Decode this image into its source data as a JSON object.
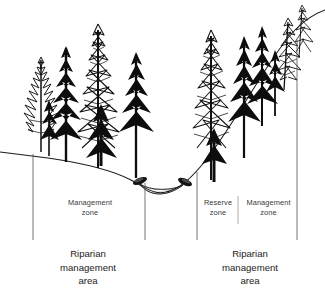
{
  "diagram": {
    "background_color": "#ffffff",
    "line_color": "#1a1a1a",
    "label_color": "#3a3a3a",
    "area_label_color": "#1c1c1c",
    "zone_labels": [
      {
        "id": "management-zone-left",
        "text": "Management\nzone"
      },
      {
        "id": "reserve-zone",
        "text": "Reserve\nzone"
      },
      {
        "id": "management-zone-right",
        "text": "Management\nzone"
      }
    ],
    "area_labels": [
      {
        "id": "riparian-management-area-left",
        "text": "Riparian\nmanagement\narea"
      },
      {
        "id": "riparian-management-area-right",
        "text": "Riparian\nmanagement\narea"
      }
    ],
    "features": [
      {
        "id": "ground-line",
        "name": "terrain-cross-section"
      },
      {
        "id": "stream-channel",
        "name": "stream-water-surface"
      },
      {
        "id": "stream-bank-left",
        "name": "stream-bank-left"
      },
      {
        "id": "stream-bank-right",
        "name": "stream-bank-right"
      },
      {
        "id": "conifer-stand",
        "name": "coniferous-forest"
      }
    ],
    "divider_lines": [
      {
        "id": "divider-1",
        "x": 33
      },
      {
        "id": "divider-2",
        "x": 145
      },
      {
        "id": "divider-3",
        "x": 197
      },
      {
        "id": "divider-4",
        "x": 238
      },
      {
        "id": "divider-5",
        "x": 297
      }
    ]
  }
}
